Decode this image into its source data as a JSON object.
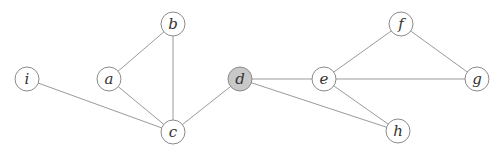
{
  "diagram": {
    "type": "undirected-graph",
    "colors": {
      "edge": "#9a9a9a",
      "node_stroke": "#8a8a8a",
      "node_fill": "#ffffff",
      "highlight_fill": "#c8c8c8",
      "label": "#333333"
    },
    "nodes": [
      {
        "id": "i",
        "label": "i",
        "x": 27,
        "y": 79,
        "highlighted": false
      },
      {
        "id": "a",
        "label": "a",
        "x": 109,
        "y": 79,
        "highlighted": false
      },
      {
        "id": "b",
        "label": "b",
        "x": 173,
        "y": 24,
        "highlighted": false
      },
      {
        "id": "c",
        "label": "c",
        "x": 173,
        "y": 132,
        "highlighted": false
      },
      {
        "id": "d",
        "label": "d",
        "x": 240,
        "y": 79,
        "highlighted": true
      },
      {
        "id": "e",
        "label": "e",
        "x": 324,
        "y": 79,
        "highlighted": false
      },
      {
        "id": "f",
        "label": "f",
        "x": 401,
        "y": 24,
        "highlighted": false
      },
      {
        "id": "g",
        "label": "g",
        "x": 477,
        "y": 79,
        "highlighted": false
      },
      {
        "id": "h",
        "label": "h",
        "x": 398,
        "y": 131,
        "highlighted": false
      }
    ],
    "edges": [
      {
        "from": "i",
        "to": "c"
      },
      {
        "from": "a",
        "to": "b"
      },
      {
        "from": "a",
        "to": "c"
      },
      {
        "from": "b",
        "to": "c"
      },
      {
        "from": "c",
        "to": "d"
      },
      {
        "from": "d",
        "to": "e"
      },
      {
        "from": "d",
        "to": "h"
      },
      {
        "from": "e",
        "to": "f"
      },
      {
        "from": "e",
        "to": "g"
      },
      {
        "from": "e",
        "to": "h"
      },
      {
        "from": "f",
        "to": "g"
      }
    ],
    "node_radius": 12
  }
}
